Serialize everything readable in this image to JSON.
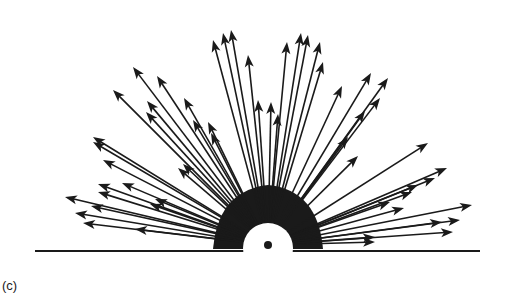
{
  "figure": {
    "caption": "(c)",
    "colors": {
      "ink": "#1a1a1a",
      "background": "#ffffff"
    },
    "origin": {
      "x": 268,
      "y": 245
    },
    "source_dot": {
      "x": 268,
      "y": 245,
      "r": 4
    },
    "white_hemisphere": {
      "x": 268,
      "y": 248,
      "r": 25
    },
    "baseline": {
      "x1": 35,
      "x2": 480,
      "y": 251
    },
    "arrow_tips": [
      [
        213,
        40
      ],
      [
        223,
        33
      ],
      [
        231,
        30
      ],
      [
        248,
        55
      ],
      [
        287,
        42
      ],
      [
        301,
        33
      ],
      [
        308,
        35
      ],
      [
        320,
        42
      ],
      [
        323,
        62
      ],
      [
        258,
        100
      ],
      [
        271,
        102
      ],
      [
        278,
        114
      ],
      [
        113,
        90
      ],
      [
        133,
        67
      ],
      [
        157,
        76
      ],
      [
        147,
        101
      ],
      [
        146,
        112
      ],
      [
        184,
        98
      ],
      [
        193,
        120
      ],
      [
        208,
        122
      ],
      [
        211,
        133
      ],
      [
        342,
        86
      ],
      [
        371,
        73
      ],
      [
        388,
        78
      ],
      [
        380,
        98
      ],
      [
        365,
        111
      ],
      [
        348,
        137
      ],
      [
        358,
        156
      ],
      [
        65,
        197
      ],
      [
        75,
        213
      ],
      [
        98,
        192
      ],
      [
        91,
        206
      ],
      [
        122,
        183
      ],
      [
        98,
        184
      ],
      [
        83,
        223
      ],
      [
        135,
        229
      ],
      [
        150,
        204
      ],
      [
        155,
        199
      ],
      [
        183,
        164
      ],
      [
        178,
        168
      ],
      [
        103,
        160
      ],
      [
        93,
        142
      ],
      [
        93,
        137
      ],
      [
        428,
        143
      ],
      [
        447,
        168
      ],
      [
        435,
        178
      ],
      [
        418,
        185
      ],
      [
        404,
        208
      ],
      [
        472,
        205
      ],
      [
        460,
        220
      ],
      [
        412,
        192
      ],
      [
        390,
        202
      ],
      [
        453,
        232
      ],
      [
        442,
        222
      ],
      [
        375,
        242
      ],
      [
        375,
        237
      ]
    ]
  }
}
